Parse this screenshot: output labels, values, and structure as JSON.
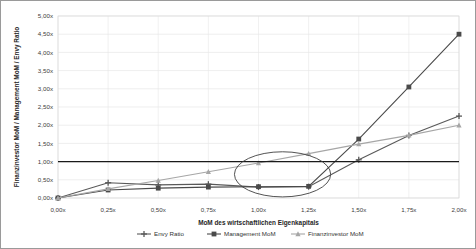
{
  "chart_data": {
    "type": "line",
    "title": "",
    "subtitle": "",
    "xlabel": "MoM des wirtschaftlichen Eigenkapitals",
    "ylabel": "Finanzinvestor MoM / Management MoM / Envy Ratio",
    "x": [
      0.0,
      0.25,
      0.5,
      0.75,
      1.0,
      1.25,
      1.5,
      1.75,
      2.0
    ],
    "xticklabels": [
      "0,00x",
      "0,25x",
      "0,50x",
      "0,75x",
      "1,00x",
      "1,25x",
      "1,50x",
      "1,75x",
      "2,00x"
    ],
    "yticklabels": [
      "0,00x",
      "0,50x",
      "1,00x",
      "1,50x",
      "2,00x",
      "2,50x",
      "3,00x",
      "3,50x",
      "4,00x",
      "4,50x",
      "5,00x"
    ],
    "yticks": [
      0.0,
      0.5,
      1.0,
      1.5,
      2.0,
      2.5,
      3.0,
      3.5,
      4.0,
      4.5,
      5.0
    ],
    "xlim": [
      0.0,
      2.0
    ],
    "ylim": [
      0.0,
      5.0
    ],
    "grid": true,
    "legend_position": "bottom",
    "series": [
      {
        "name": "Envy Ratio",
        "marker": "cross",
        "color": "#595959",
        "values": [
          0.0,
          0.42,
          0.36,
          0.38,
          0.3,
          0.31,
          1.05,
          1.72,
          2.25
        ]
      },
      {
        "name": "Management MoM",
        "marker": "square",
        "color": "#4a4a4a",
        "values": [
          0.0,
          0.22,
          0.27,
          0.3,
          0.31,
          0.32,
          1.62,
          3.05,
          4.5
        ]
      },
      {
        "name": "Finanzinvestor MoM",
        "marker": "triangle",
        "color": "#a6a6a6",
        "values": [
          0.0,
          0.25,
          0.48,
          0.72,
          0.96,
          1.22,
          1.48,
          1.72,
          2.0
        ]
      }
    ],
    "reference_line": {
      "name": "one-x-baseline",
      "value": 1.0,
      "color": "#1a1a1a"
    },
    "annotations": [
      {
        "name": "highlight-ellipse",
        "shape": "ellipse",
        "center_x": 1.12,
        "center_y": 0.65,
        "radius_x": 0.24,
        "radius_y": 0.62
      }
    ]
  }
}
